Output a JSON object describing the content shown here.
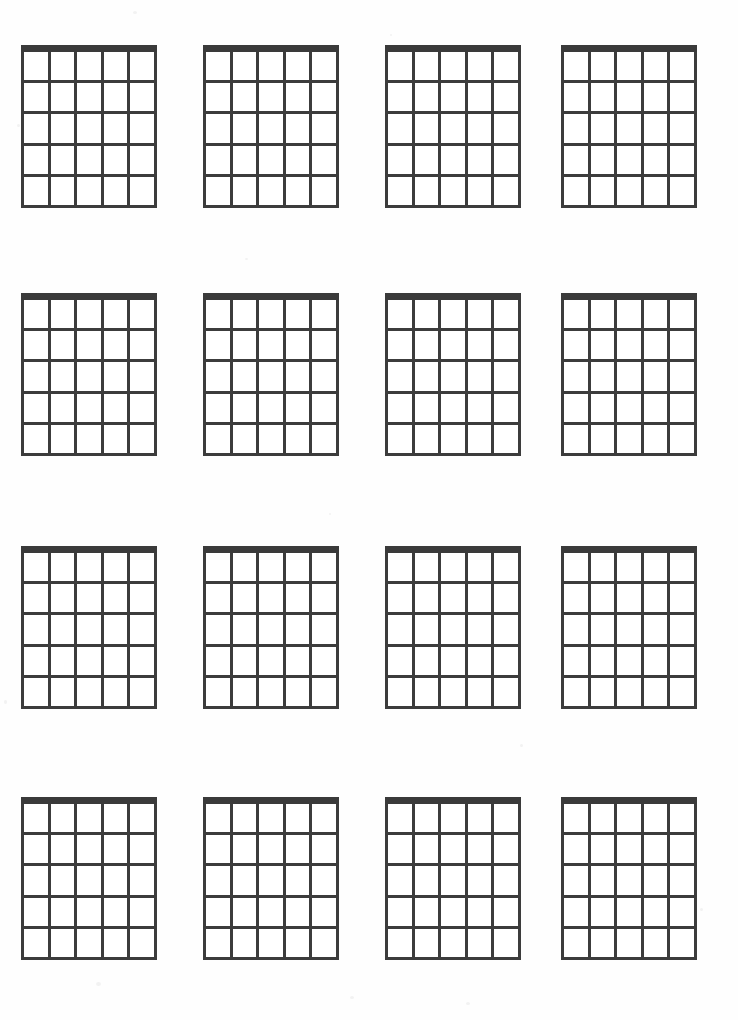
{
  "document": {
    "title": "Blank Guitar Chord Chart Sheet",
    "page_label": "",
    "background_color": "#ffffff",
    "line_color": "#3c3c3c",
    "nut_color": "#3a3a3a"
  },
  "sheet": {
    "grid_layout": {
      "columns": 4,
      "rows": 4,
      "total_diagrams": 16
    },
    "diagram_spec": {
      "strings": 6,
      "string_spaces": 5,
      "frets": 5,
      "nut_thickness_px": 7,
      "line_thickness_px": 3,
      "width_px": 136,
      "height_px": 163
    },
    "column_x_px": [
      21,
      203,
      385,
      561
    ],
    "row_y_px": [
      45,
      293,
      546,
      797
    ],
    "diagrams": [
      {
        "id": "chord-1",
        "row": 1,
        "col": 1,
        "label": ""
      },
      {
        "id": "chord-2",
        "row": 1,
        "col": 2,
        "label": ""
      },
      {
        "id": "chord-3",
        "row": 1,
        "col": 3,
        "label": ""
      },
      {
        "id": "chord-4",
        "row": 1,
        "col": 4,
        "label": ""
      },
      {
        "id": "chord-5",
        "row": 2,
        "col": 1,
        "label": ""
      },
      {
        "id": "chord-6",
        "row": 2,
        "col": 2,
        "label": ""
      },
      {
        "id": "chord-7",
        "row": 2,
        "col": 3,
        "label": ""
      },
      {
        "id": "chord-8",
        "row": 2,
        "col": 4,
        "label": ""
      },
      {
        "id": "chord-9",
        "row": 3,
        "col": 1,
        "label": ""
      },
      {
        "id": "chord-10",
        "row": 3,
        "col": 2,
        "label": ""
      },
      {
        "id": "chord-11",
        "row": 3,
        "col": 3,
        "label": ""
      },
      {
        "id": "chord-12",
        "row": 3,
        "col": 4,
        "label": ""
      },
      {
        "id": "chord-13",
        "row": 4,
        "col": 1,
        "label": ""
      },
      {
        "id": "chord-14",
        "row": 4,
        "col": 2,
        "label": ""
      },
      {
        "id": "chord-15",
        "row": 4,
        "col": 3,
        "label": ""
      },
      {
        "id": "chord-16",
        "row": 4,
        "col": 4,
        "label": ""
      }
    ]
  }
}
